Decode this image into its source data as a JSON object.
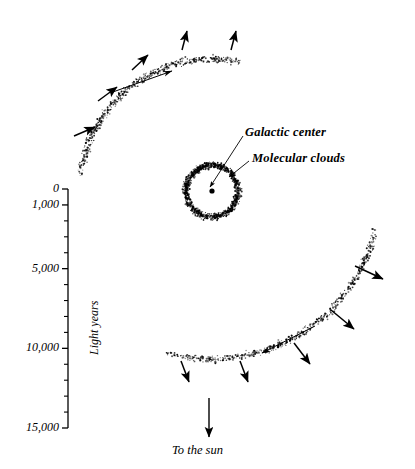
{
  "figure": {
    "type": "diagram",
    "background_color": "#ffffff",
    "ink_color": "#000000"
  },
  "callouts": [
    {
      "id": "galactic-center",
      "label": "Galactic center",
      "x": 245,
      "y": 126,
      "leader_from": [
        243,
        136
      ],
      "leader_to": [
        210,
        187
      ],
      "target": "center-dot"
    },
    {
      "id": "molecular-clouds",
      "label": "Molecular clouds",
      "x": 252,
      "y": 152,
      "leader_from": [
        249,
        161
      ],
      "leader_to": [
        229,
        177
      ],
      "target": "cloud-ring"
    }
  ],
  "bottom_label": {
    "id": "to-the-sun",
    "label": "To the sun",
    "x": 172,
    "y": 444,
    "arrow_from": [
      209,
      398
    ],
    "arrow_to": [
      209,
      437
    ]
  },
  "axis": {
    "title": "Light years",
    "title_x": 88,
    "title_y": 355,
    "line_x": 68,
    "line_top": 189,
    "line_bottom": 428,
    "unit": "light years",
    "range": [
      0,
      15000
    ],
    "tick_labels": [
      {
        "value": 0,
        "text": "0",
        "y": 189
      },
      {
        "value": 1000,
        "text": "1,000",
        "y": 213
      },
      {
        "value": 5000,
        "text": "5,000",
        "y": 285
      },
      {
        "value": 10000,
        "text": "10,000",
        "y": 357
      },
      {
        "value": 15000,
        "text": "15,000",
        "y": 428
      }
    ],
    "minor_tick_values": [
      2000,
      3000,
      4000,
      6000,
      7000,
      8000,
      9000,
      11000,
      12000,
      13000,
      14000
    ]
  },
  "chart_data": {
    "type": "scatter",
    "title": "",
    "xlabel": "",
    "ylabel": "Light years",
    "ylim": [
      0,
      15000
    ],
    "features": [
      {
        "name": "cloud-ring",
        "kind": "stippled-annulus",
        "center": [
          212,
          191
        ],
        "outer_radius": 31,
        "inner_radius": 21,
        "dot_count": 900
      },
      {
        "name": "center-dot",
        "kind": "point",
        "center": [
          212,
          191
        ],
        "radius": 2.6
      },
      {
        "name": "upper-arm",
        "kind": "stippled-arc",
        "arc_center": [
          212,
          191
        ],
        "arc_radius": 132,
        "start_angle_deg": 186,
        "end_angle_deg": 284,
        "band_width": 9,
        "dot_count": 620
      },
      {
        "name": "lower-arm",
        "kind": "stippled-arc",
        "arc_center": [
          212,
          191
        ],
        "arc_radius": 168,
        "start_angle_deg": 12,
        "end_angle_deg": 106,
        "band_width": 9,
        "dot_count": 640
      }
    ],
    "upper_arm_arrows": [
      {
        "from": [
          74,
          136
        ],
        "to": [
          95,
          127
        ],
        "kind": "radial"
      },
      {
        "from": [
          98,
          101
        ],
        "to": [
          117,
          87
        ],
        "kind": "radial"
      },
      {
        "from": [
          132,
          70
        ],
        "to": [
          148,
          55
        ],
        "kind": "radial"
      },
      {
        "from": [
          182,
          50
        ],
        "to": [
          187,
          31
        ],
        "kind": "radial"
      },
      {
        "from": [
          231,
          50
        ],
        "to": [
          236,
          31
        ],
        "kind": "radial"
      },
      {
        "from": [
          110,
          93
        ],
        "to": [
          172,
          71
        ],
        "kind": "tangential"
      }
    ],
    "lower_arm_arrows": [
      {
        "from": [
          355,
          266
        ],
        "to": [
          383,
          279
        ],
        "kind": "radial"
      },
      {
        "from": [
          331,
          310
        ],
        "to": [
          354,
          329
        ],
        "kind": "radial"
      },
      {
        "from": [
          294,
          343
        ],
        "to": [
          310,
          364
        ],
        "kind": "radial"
      },
      {
        "from": [
          240,
          361
        ],
        "to": [
          248,
          382
        ],
        "kind": "radial"
      },
      {
        "from": [
          181,
          361
        ],
        "to": [
          189,
          382
        ],
        "kind": "radial"
      },
      {
        "from": [
          315,
          326
        ],
        "to": [
          262,
          353
        ],
        "kind": "tangential"
      }
    ]
  }
}
